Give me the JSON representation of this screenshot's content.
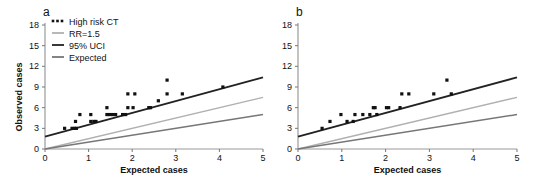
{
  "chart_data": [
    {
      "type": "scatter",
      "panel_label": "a",
      "title": "",
      "xlabel": "Expected cases",
      "ylabel": "Observed cases",
      "xlim": [
        0,
        5
      ],
      "ylim": [
        0,
        18
      ],
      "x_ticks": [
        0,
        1,
        2,
        3,
        4,
        5
      ],
      "y_ticks": [
        0,
        3,
        6,
        9,
        12,
        15,
        18
      ],
      "grid": false,
      "legend_position": "upper-left",
      "legend": [
        {
          "label": "High risk CT",
          "kind": "dots",
          "color": "#111111"
        },
        {
          "label": "RR=1.5",
          "kind": "line",
          "color": "#b0b0b0"
        },
        {
          "label": "95% UCI",
          "kind": "line",
          "color": "#222222"
        },
        {
          "label": "Expected",
          "kind": "line",
          "color": "#777777"
        }
      ],
      "series": [
        {
          "name": "High risk CT",
          "type": "scatter",
          "points": [
            [
              0.45,
              3
            ],
            [
              0.62,
              3
            ],
            [
              0.68,
              3
            ],
            [
              0.72,
              3
            ],
            [
              0.7,
              4
            ],
            [
              0.8,
              5
            ],
            [
              1.05,
              4
            ],
            [
              1.05,
              5
            ],
            [
              1.12,
              4
            ],
            [
              1.17,
              4
            ],
            [
              1.42,
              6
            ],
            [
              1.42,
              5
            ],
            [
              1.48,
              5
            ],
            [
              1.55,
              5
            ],
            [
              1.62,
              5
            ],
            [
              1.78,
              5
            ],
            [
              1.85,
              5
            ],
            [
              1.9,
              6
            ],
            [
              1.9,
              8
            ],
            [
              2.02,
              6
            ],
            [
              2.06,
              8
            ],
            [
              2.38,
              6
            ],
            [
              2.42,
              6
            ],
            [
              2.6,
              7
            ],
            [
              2.8,
              10
            ],
            [
              2.8,
              8
            ],
            [
              3.15,
              8
            ],
            [
              4.08,
              9
            ]
          ]
        },
        {
          "name": "RR=1.5",
          "type": "line",
          "x": [
            0,
            5
          ],
          "y": [
            0,
            7.5
          ]
        },
        {
          "name": "95% UCI",
          "type": "line",
          "x": [
            0,
            5
          ],
          "y": [
            1.8,
            10.4
          ]
        },
        {
          "name": "Expected",
          "type": "line",
          "x": [
            0,
            5
          ],
          "y": [
            0,
            5
          ]
        }
      ]
    },
    {
      "type": "scatter",
      "panel_label": "b",
      "title": "",
      "xlabel": "Expected cases",
      "ylabel": "",
      "xlim": [
        0,
        5
      ],
      "ylim": [
        0,
        18
      ],
      "x_ticks": [
        0,
        1,
        2,
        3,
        4,
        5
      ],
      "y_ticks": [
        0,
        3,
        6,
        9,
        12,
        15,
        18
      ],
      "grid": false,
      "legend": [],
      "series": [
        {
          "name": "High risk CT",
          "type": "scatter",
          "points": [
            [
              0.55,
              3
            ],
            [
              0.73,
              4
            ],
            [
              0.98,
              5
            ],
            [
              1.12,
              4
            ],
            [
              1.26,
              4
            ],
            [
              1.3,
              5
            ],
            [
              1.48,
              5
            ],
            [
              1.64,
              5
            ],
            [
              1.72,
              6
            ],
            [
              1.76,
              6
            ],
            [
              1.8,
              5
            ],
            [
              2.02,
              6
            ],
            [
              2.07,
              6
            ],
            [
              2.33,
              6
            ],
            [
              2.37,
              8
            ],
            [
              2.53,
              8
            ],
            [
              3.1,
              8
            ],
            [
              3.4,
              10
            ],
            [
              3.5,
              8
            ]
          ]
        },
        {
          "name": "RR=1.5",
          "type": "line",
          "x": [
            0,
            5
          ],
          "y": [
            0,
            7.5
          ]
        },
        {
          "name": "95% UCI",
          "type": "line",
          "x": [
            0,
            5
          ],
          "y": [
            1.8,
            10.4
          ]
        },
        {
          "name": "Expected",
          "type": "line",
          "x": [
            0,
            5
          ],
          "y": [
            0,
            5
          ]
        }
      ]
    }
  ],
  "layout": {
    "panels": [
      {
        "x0": 45,
        "x1": 263,
        "y0": 149,
        "y1": 25
      },
      {
        "x0": 298,
        "x1": 517,
        "y0": 149,
        "y1": 25
      }
    ],
    "colors": {
      "axis": "#111111",
      "rr_line": "#b0b0b0",
      "uci_line": "#222222",
      "expected_line": "#777777",
      "points": "#111111"
    }
  }
}
